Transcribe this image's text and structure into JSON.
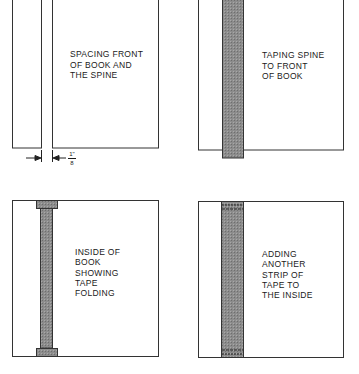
{
  "colors": {
    "outline": "#333333",
    "tape_fill": "#8c8c8c",
    "background": "#ffffff"
  },
  "panels": [
    {
      "id": "spacing",
      "caption": "SPACING FRONT\nOF BOOK AND\nTHE SPINE",
      "dimension": {
        "numerator": "1\"",
        "denominator": "8",
        "label": "1/8 inch gap"
      }
    },
    {
      "id": "taping",
      "caption": "TAPING SPINE\nTO FRONT\nOF BOOK"
    },
    {
      "id": "inside",
      "caption": "INSIDE OF\nBOOK\nSHOWING\nTAPE\nFOLDING"
    },
    {
      "id": "adding",
      "caption": "ADDING\nANOTHER\nSTRIP OF\nTAPE TO\nTHE INSIDE"
    }
  ]
}
